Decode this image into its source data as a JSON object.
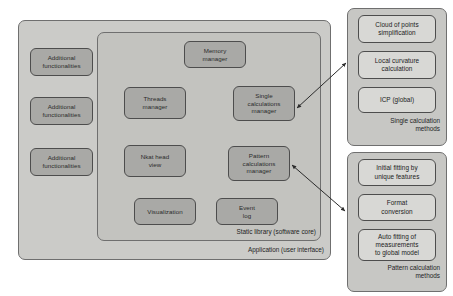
{
  "diagram": {
    "colors": {
      "panel_fill": "#c9c9c6",
      "module_fill": "#a9a9a6",
      "light_fill": "#d8d8d5",
      "stroke": "#4d4d4d",
      "text": "#2b2b2b"
    },
    "application": {
      "caption": "Application (user interface)",
      "additional": [
        {
          "label": "Additional\nfunctionalities"
        },
        {
          "label": "Additional\nfunctionalities"
        },
        {
          "label": "Additional\nfunctionalities"
        }
      ]
    },
    "static_library": {
      "caption": "Static library (software core)",
      "modules": [
        {
          "label": "Memory\nmanager"
        },
        {
          "label": "Threads\nmanager"
        },
        {
          "label": "Single\ncalculations\nmanager"
        },
        {
          "label": "Nkat head\nview"
        },
        {
          "label": "Pattern\ncalculations\nmanager"
        },
        {
          "label": "Visualization"
        },
        {
          "label": "Event\nlog"
        }
      ]
    },
    "single_calculation_panel": {
      "caption": "Single calculation\nmethods",
      "items": [
        {
          "label": "Cloud of points\nsimplification"
        },
        {
          "label": "Local curvature\ncalculation"
        },
        {
          "label": "ICP (global)"
        }
      ]
    },
    "pattern_calculation_panel": {
      "caption": "Pattern calculation\nmethods",
      "items": [
        {
          "label": "Initial fitting by\nunique features"
        },
        {
          "label": "Format\nconversion"
        },
        {
          "label": "Auto fitting of\nmeasurements\nto global model"
        }
      ]
    },
    "connectors": [
      {
        "name": "single-calc-connector",
        "from": "Single calculations manager",
        "to": "Single calculation methods",
        "style": "double-headed-arrow"
      },
      {
        "name": "pattern-calc-connector",
        "from": "Pattern calculations manager",
        "to": "Pattern calculation methods",
        "style": "double-headed-arrow"
      }
    ]
  }
}
